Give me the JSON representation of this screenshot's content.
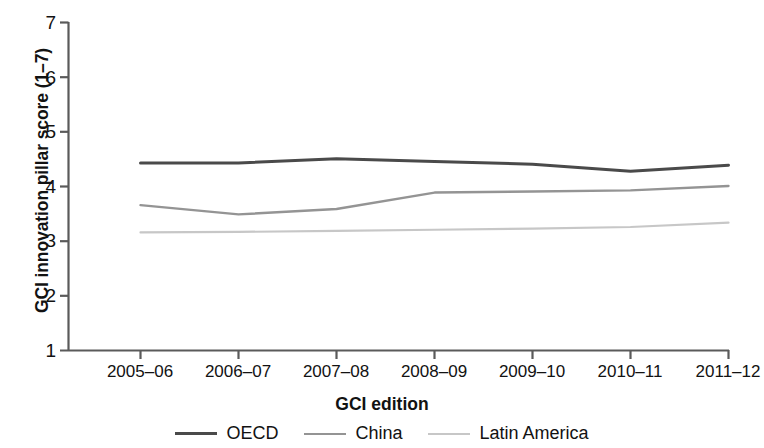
{
  "chart_data": {
    "type": "line",
    "title": "",
    "xlabel": "GCI edition",
    "ylabel": "GCI innovation pillar score (1–7)",
    "categories": [
      "2005–06",
      "2006–07",
      "2007–08",
      "2008–09",
      "2009–10",
      "2010–11",
      "2011–12"
    ],
    "ylim": [
      1,
      7
    ],
    "y_ticks": [
      1,
      2,
      3,
      4,
      5,
      6,
      7
    ],
    "y_tick_labels": [
      "1",
      "2",
      "3",
      "4",
      "5",
      "6",
      "7"
    ],
    "grid": false,
    "legend_position": "bottom-center",
    "series": [
      {
        "name": "OECD",
        "color": "#4a4a4a",
        "width": 3.0,
        "values": [
          4.42,
          4.42,
          4.5,
          4.45,
          4.4,
          4.27,
          4.38
        ]
      },
      {
        "name": "China",
        "color": "#949494",
        "width": 2.4,
        "values": [
          3.65,
          3.48,
          3.58,
          3.88,
          3.9,
          3.92,
          4.0
        ]
      },
      {
        "name": "Latin America",
        "color": "#c7c7c7",
        "width": 2.2,
        "values": [
          3.15,
          3.16,
          3.18,
          3.2,
          3.22,
          3.25,
          3.33
        ]
      }
    ]
  },
  "axes": {
    "y_title": "GCI innovation pillar score (1–7)",
    "x_title": "GCI edition",
    "y_tick_labels": [
      "7",
      "6",
      "5",
      "4",
      "3",
      "2",
      "1"
    ],
    "x_tick_labels": [
      "2005–06",
      "2006–07",
      "2007–08",
      "2008–09",
      "2009–10",
      "2010–11",
      "2011–12"
    ]
  },
  "legend": {
    "items": [
      {
        "label": "OECD",
        "color": "#4a4a4a",
        "width": 3.0
      },
      {
        "label": "China",
        "color": "#949494",
        "width": 2.4
      },
      {
        "label": "Latin America",
        "color": "#c7c7c7",
        "width": 2.2
      }
    ]
  },
  "colors": {
    "axis": "#5a5a5a",
    "text": "#121212",
    "background": "#ffffff"
  }
}
